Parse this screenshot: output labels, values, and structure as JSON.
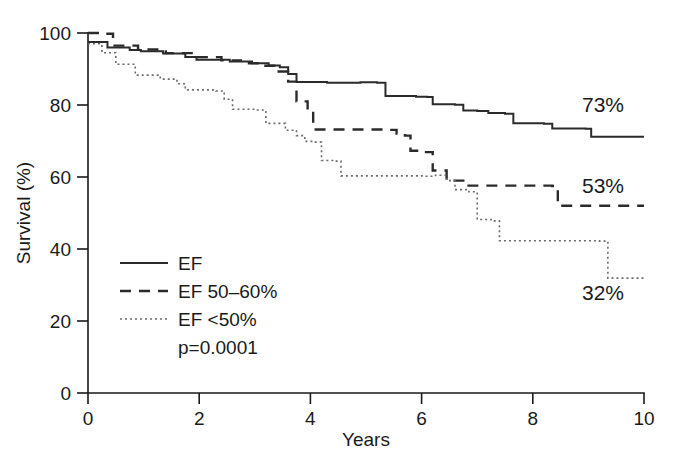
{
  "chart_data": {
    "type": "line",
    "title": "",
    "subtitle": "",
    "xlabel": "Years",
    "ylabel": "Survival (%)",
    "xlim": [
      0,
      10
    ],
    "ylim": [
      0,
      100
    ],
    "xticks": [
      "0",
      "2",
      "4",
      "6",
      "8",
      "10"
    ],
    "xtick_values": [
      0,
      2,
      4,
      6,
      8,
      10
    ],
    "yticks": [
      "0",
      "20",
      "40",
      "60",
      "80",
      "100"
    ],
    "ytick_values": [
      0,
      20,
      40,
      60,
      80,
      100
    ],
    "grid": false,
    "legend_position": "lower-left",
    "annotations": [
      {
        "text": "p=0.0001",
        "role": "p-value"
      },
      {
        "text": "73%",
        "role": "endpoint-solid"
      },
      {
        "text": "53%",
        "role": "endpoint-dashed"
      },
      {
        "text": "32%",
        "role": "endpoint-dotted"
      }
    ],
    "series": [
      {
        "name": "EF",
        "style": "solid",
        "color": "#2b2b2b",
        "final_value": 73,
        "final_label": "73%",
        "points": [
          [
            0.0,
            97.5
          ],
          [
            0.35,
            96.0
          ],
          [
            0.75,
            95.3
          ],
          [
            0.95,
            94.9
          ],
          [
            1.35,
            94.3
          ],
          [
            1.75,
            93.3
          ],
          [
            1.95,
            92.6
          ],
          [
            2.55,
            92.1
          ],
          [
            2.95,
            91.6
          ],
          [
            3.25,
            91.0
          ],
          [
            3.45,
            90.5
          ],
          [
            3.6,
            88.6
          ],
          [
            3.75,
            86.4
          ],
          [
            4.3,
            86.2
          ],
          [
            4.9,
            86.3
          ],
          [
            5.2,
            86.2
          ],
          [
            5.35,
            82.5
          ],
          [
            5.9,
            82.3
          ],
          [
            6.1,
            82.2
          ],
          [
            6.2,
            80.2
          ],
          [
            6.6,
            80.1
          ],
          [
            6.75,
            78.5
          ],
          [
            7.0,
            78.3
          ],
          [
            7.2,
            77.8
          ],
          [
            7.5,
            77.6
          ],
          [
            7.65,
            74.9
          ],
          [
            8.2,
            74.8
          ],
          [
            8.35,
            73.5
          ],
          [
            8.95,
            73.4
          ],
          [
            9.05,
            71.2
          ],
          [
            10.0,
            71.2
          ]
        ]
      },
      {
        "name": "EF 50–60%",
        "style": "dashed",
        "color": "#2b2b2b",
        "final_value": 53,
        "final_label": "53%",
        "points": [
          [
            0.0,
            100.0
          ],
          [
            0.3,
            99.8
          ],
          [
            0.45,
            96.5
          ],
          [
            0.9,
            95.4
          ],
          [
            1.4,
            94.4
          ],
          [
            1.9,
            93.3
          ],
          [
            2.4,
            92.4
          ],
          [
            2.75,
            91.6
          ],
          [
            3.05,
            90.9
          ],
          [
            3.35,
            89.3
          ],
          [
            3.6,
            86.5
          ],
          [
            3.75,
            81.0
          ],
          [
            3.95,
            78.2
          ],
          [
            4.05,
            73.2
          ],
          [
            5.35,
            73.1
          ],
          [
            5.55,
            72.1
          ],
          [
            5.7,
            71.5
          ],
          [
            5.8,
            67.3
          ],
          [
            6.05,
            66.9
          ],
          [
            6.2,
            61.8
          ],
          [
            6.45,
            59.0
          ],
          [
            6.75,
            57.6
          ],
          [
            8.35,
            57.5
          ],
          [
            8.45,
            52.0
          ],
          [
            10.0,
            52.0
          ]
        ]
      },
      {
        "name": "EF <50%",
        "style": "dotted",
        "color": "#6a6a6a",
        "final_value": 32,
        "final_label": "32%",
        "points": [
          [
            0.0,
            97.0
          ],
          [
            0.25,
            94.5
          ],
          [
            0.5,
            91.3
          ],
          [
            0.85,
            88.3
          ],
          [
            1.3,
            87.2
          ],
          [
            1.6,
            85.9
          ],
          [
            1.75,
            84.2
          ],
          [
            2.3,
            83.9
          ],
          [
            2.45,
            81.6
          ],
          [
            2.6,
            78.8
          ],
          [
            3.0,
            78.6
          ],
          [
            3.2,
            74.9
          ],
          [
            3.55,
            73.0
          ],
          [
            3.75,
            71.5
          ],
          [
            3.9,
            69.9
          ],
          [
            4.05,
            69.7
          ],
          [
            4.2,
            64.6
          ],
          [
            4.45,
            64.4
          ],
          [
            4.55,
            60.3
          ],
          [
            6.05,
            60.2
          ],
          [
            6.25,
            60.5
          ],
          [
            6.45,
            59.0
          ],
          [
            6.6,
            56.5
          ],
          [
            6.85,
            55.9
          ],
          [
            7.0,
            48.2
          ],
          [
            7.25,
            47.8
          ],
          [
            7.4,
            42.3
          ],
          [
            9.2,
            42.2
          ],
          [
            9.35,
            31.9
          ],
          [
            10.0,
            31.9
          ]
        ]
      }
    ]
  },
  "legend": {
    "items": [
      {
        "label": "EF",
        "style": "solid"
      },
      {
        "label": "EF 50–60%",
        "style": "dashed"
      },
      {
        "label": "EF <50%",
        "style": "dotted"
      }
    ],
    "pvalue": "p=0.0001"
  },
  "axes": {
    "x_title": "Years",
    "y_title": "Survival (%)"
  },
  "colors": {
    "background": "#ffffff",
    "axis": "#1a1a1a",
    "text": "#1a1a1a",
    "solid": "#2b2b2b",
    "dashed": "#2b2b2b",
    "dotted": "#6a6a6a"
  }
}
